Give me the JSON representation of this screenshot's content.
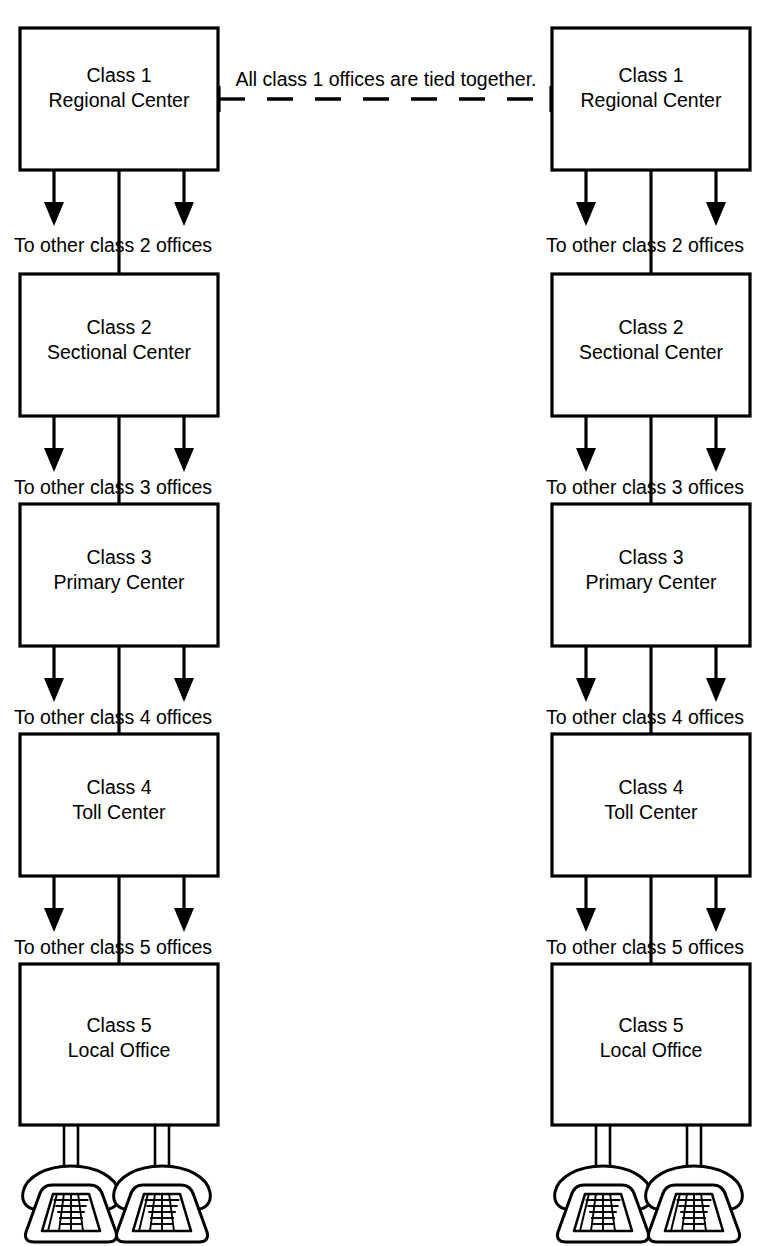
{
  "diagram": {
    "tie_note": "All class 1 offices are tied together.",
    "colors": {
      "stroke": "#000000",
      "background": "#ffffff"
    },
    "columns": [
      {
        "id": "left",
        "name": "left-hierarchy-column"
      },
      {
        "id": "right",
        "name": "right-hierarchy-column"
      }
    ],
    "levels": [
      {
        "class_label": "Class 1",
        "name_label": "Regional Center",
        "branch_label": "To other class 2 offices"
      },
      {
        "class_label": "Class 2",
        "name_label": "Sectional Center",
        "branch_label": "To other class 3 offices"
      },
      {
        "class_label": "Class 3",
        "name_label": "Primary Center",
        "branch_label": "To other class 4 offices"
      },
      {
        "class_label": "Class 4",
        "name_label": "Toll Center",
        "branch_label": "To other class 5 offices"
      },
      {
        "class_label": "Class 5",
        "name_label": "Local Office",
        "branch_label": ""
      }
    ],
    "subscribers": [
      {
        "icon": "telephone-icon"
      },
      {
        "icon": "telephone-icon"
      }
    ]
  }
}
